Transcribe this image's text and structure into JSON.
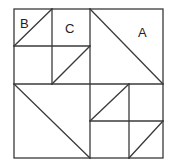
{
  "diagram": {
    "type": "tangram-square-puzzle",
    "labels": {
      "a": "A",
      "b": "B",
      "c": "C"
    },
    "colors": {
      "stroke": "#3a3a3a",
      "background": "#ffffff",
      "text": "#222222"
    }
  }
}
